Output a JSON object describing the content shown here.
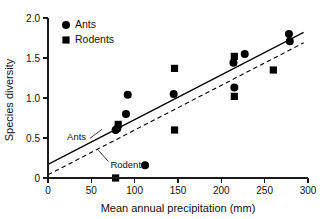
{
  "chart_data": {
    "type": "scatter",
    "title": "",
    "xlabel": "Mean annual precipitation (mm)",
    "ylabel": "Species diversity",
    "xlim": [
      0,
      300
    ],
    "ylim": [
      0,
      2.0
    ],
    "xticks": [
      "0",
      "50",
      "100",
      "150",
      "200",
      "250",
      "300"
    ],
    "xtick_values": [
      0,
      50,
      100,
      150,
      200,
      250,
      300
    ],
    "yticks": [
      "0",
      "0.5",
      "1.0",
      "1.5",
      "2.0"
    ],
    "ytick_values": [
      0,
      0.5,
      1.0,
      1.5,
      2.0
    ],
    "grid": false,
    "legend_position": "top-left",
    "series": [
      {
        "name": "Ants",
        "marker": "circle",
        "color": "#000000",
        "points": [
          {
            "x": 78,
            "y": 0.6
          },
          {
            "x": 80,
            "y": 0.62
          },
          {
            "x": 90,
            "y": 0.8
          },
          {
            "x": 92,
            "y": 1.04
          },
          {
            "x": 112,
            "y": 0.16
          },
          {
            "x": 145,
            "y": 1.05
          },
          {
            "x": 214,
            "y": 1.44
          },
          {
            "x": 215,
            "y": 1.13
          },
          {
            "x": 227,
            "y": 1.55
          },
          {
            "x": 278,
            "y": 1.8
          },
          {
            "x": 279,
            "y": 1.71
          }
        ]
      },
      {
        "name": "Rodents",
        "marker": "square",
        "color": "#000000",
        "points": [
          {
            "x": 78,
            "y": 0.0
          },
          {
            "x": 81,
            "y": 0.67
          },
          {
            "x": 146,
            "y": 1.37
          },
          {
            "x": 146,
            "y": 0.6
          },
          {
            "x": 215,
            "y": 1.52
          },
          {
            "x": 215,
            "y": 1.02
          },
          {
            "x": 260,
            "y": 1.35
          }
        ]
      }
    ],
    "fit_lines": [
      {
        "name": "Ants",
        "style": "solid",
        "label": "Ants",
        "x_start": 0,
        "y_start": 0.17,
        "x_end": 295,
        "y_end": 1.82
      },
      {
        "name": "Rodents",
        "style": "dashed",
        "label": "Rodents",
        "x_start": 0,
        "y_start": 0.04,
        "x_end": 295,
        "y_end": 1.69
      }
    ],
    "annotations": [
      {
        "text": "Ants",
        "x": 22,
        "y": 0.52
      },
      {
        "text": "Rodents",
        "x": 72,
        "y": 0.17
      }
    ],
    "legend": [
      {
        "label": "Ants",
        "marker": "circle"
      },
      {
        "label": "Rodents",
        "marker": "square"
      }
    ]
  }
}
